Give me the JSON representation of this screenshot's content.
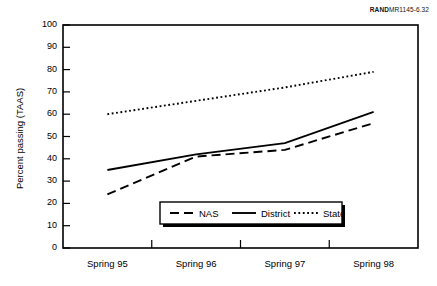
{
  "source_note": {
    "brand": "RAND",
    "code": "MR1145-6.32"
  },
  "chart_data": {
    "type": "line",
    "title": "",
    "xlabel": "",
    "ylabel": "Percent passing (TAAS)",
    "categories": [
      "Spring 95",
      "Spring 96",
      "Spring 97",
      "Spring 98"
    ],
    "ylim": [
      0,
      100
    ],
    "yticks": [
      0,
      10,
      20,
      30,
      40,
      50,
      60,
      70,
      80,
      90,
      100
    ],
    "grid": false,
    "legend_position": "bottom-center",
    "series": [
      {
        "name": "NAS",
        "style": "dashed",
        "color": "#000000",
        "values": [
          24,
          41,
          44,
          56
        ]
      },
      {
        "name": "District",
        "style": "solid",
        "color": "#000000",
        "values": [
          35,
          42,
          47,
          61
        ]
      },
      {
        "name": "State",
        "style": "dotted",
        "color": "#000000",
        "values": [
          60,
          66,
          72,
          79
        ]
      }
    ]
  }
}
